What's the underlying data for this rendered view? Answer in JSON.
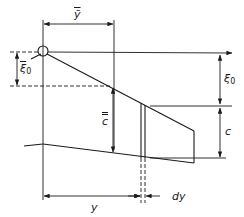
{
  "diagram": {
    "type": "wing planform geometry (mean aerodynamic chord)",
    "labels": {
      "y_bar": "ȳ",
      "xi0_bar_base": "ξ̄",
      "xi0_bar_sub": "0",
      "xi0_base": "ξ",
      "xi0_sub": "0",
      "c_double_bar": "c",
      "c": "c",
      "y": "y",
      "dy": "dy"
    },
    "colors": {
      "line": "#1a1a1a",
      "background": "#ffffff"
    }
  }
}
